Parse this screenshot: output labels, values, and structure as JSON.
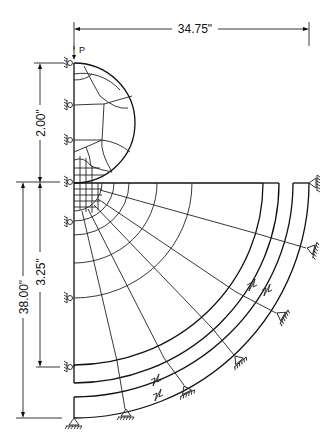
{
  "figure": {
    "load_label": "P",
    "dimensions": {
      "width_top": "34.75\"",
      "upper_height": "2.00\"",
      "inner_height": "3.25\"",
      "total_height": "38.00\""
    },
    "colors": {
      "line": "#111111",
      "background": "#ffffff"
    }
  }
}
